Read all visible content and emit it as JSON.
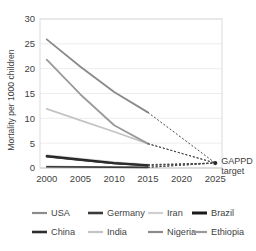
{
  "chart_data": {
    "type": "line",
    "title": "",
    "xlabel": "",
    "ylabel": "Mortality per 1000 children",
    "x": [
      2000,
      2005,
      2010,
      2015,
      2020,
      2025
    ],
    "xlim": [
      1999,
      2026
    ],
    "ylim": [
      0,
      30
    ],
    "yticks": [
      0,
      5,
      10,
      15,
      20,
      25,
      30
    ],
    "xticks": [
      2000,
      2005,
      2010,
      2015,
      2020,
      2025
    ],
    "xtick_labels": [
      "2000",
      "2005",
      "2010",
      "2015",
      "2020",
      "2025"
    ],
    "ytick_labels": [
      "0",
      "5",
      "10",
      "15",
      "20",
      "25",
      "30"
    ],
    "grid": true,
    "legend_position": "bottom",
    "projection_style": "dotted",
    "projection_from_year": 2015,
    "target_year": 2025,
    "target_value": 1,
    "annotations": [
      {
        "name": "gappd-target",
        "line1": "GAPPD",
        "line2": "target",
        "x": 2025,
        "y": 1
      }
    ],
    "series": [
      {
        "name": "USA",
        "color": "#8c8c8c",
        "width": 1.6,
        "x": [
          2000,
          2005,
          2010,
          2015
        ],
        "values": [
          0.3,
          0.25,
          0.2,
          0.15
        ],
        "projection": [
          0.15,
          1
        ]
      },
      {
        "name": "Germany",
        "color": "#3a3a3a",
        "width": 1.6,
        "x": [
          2000,
          2005,
          2010,
          2015
        ],
        "values": [
          0.25,
          0.2,
          0.15,
          0.12
        ],
        "projection": [
          0.12,
          1
        ]
      },
      {
        "name": "Iran",
        "color": "#d0d0d0",
        "width": 1.6,
        "x": [
          2000,
          2005,
          2010,
          2015
        ],
        "values": [
          2.6,
          1.9,
          1.2,
          0.7
        ],
        "projection": [
          0.7,
          1
        ]
      },
      {
        "name": "Brazil",
        "color": "#1a1a1a",
        "width": 2.2,
        "x": [
          2000,
          2005,
          2010,
          2015
        ],
        "values": [
          2.4,
          1.7,
          1.0,
          0.55
        ],
        "projection": [
          0.55,
          1
        ]
      },
      {
        "name": "China",
        "color": "#2e2e2e",
        "width": 1.8,
        "x": [
          2000,
          2005,
          2010,
          2015
        ],
        "values": [
          2.3,
          1.6,
          0.95,
          0.5
        ],
        "projection": [
          0.5,
          1
        ]
      },
      {
        "name": "India",
        "color": "#c4c4c4",
        "width": 1.8,
        "x": [
          2000,
          2005,
          2010,
          2015
        ],
        "values": [
          11.9,
          9.6,
          7.3,
          4.9
        ],
        "projection": [
          4.9,
          1
        ]
      },
      {
        "name": "Nigeria",
        "color": "#8a8a8a",
        "width": 1.8,
        "x": [
          2000,
          2005,
          2010,
          2015
        ],
        "values": [
          25.9,
          20.4,
          15.3,
          11.2
        ],
        "projection": [
          11.2,
          1
        ]
      },
      {
        "name": "Ethiopia",
        "color": "#9a9a9a",
        "width": 1.8,
        "x": [
          2000,
          2005,
          2010,
          2015
        ],
        "values": [
          21.8,
          14.8,
          8.6,
          4.9
        ],
        "projection": [
          4.9,
          1
        ]
      }
    ]
  },
  "legend": {
    "rows": [
      [
        {
          "label": "USA",
          "color": "#8c8c8c",
          "width": 2.2
        },
        {
          "label": "Germany",
          "color": "#3a3a3a",
          "width": 2.6
        },
        {
          "label": "Iran",
          "color": "#d0d0d0",
          "width": 2.2
        },
        {
          "label": "Brazil",
          "color": "#1a1a1a",
          "width": 3.0
        }
      ],
      [
        {
          "label": "China",
          "color": "#2e2e2e",
          "width": 2.6
        },
        {
          "label": "India",
          "color": "#c4c4c4",
          "width": 2.2
        },
        {
          "label": "Nigeria",
          "color": "#8a8a8a",
          "width": 2.2
        },
        {
          "label": "Ethiopia",
          "color": "#9a9a9a",
          "width": 2.2
        }
      ]
    ]
  },
  "colors": {
    "background": "#ffffff",
    "text": "#3f3f3f",
    "grid": "#e8e8e8",
    "plot_border": "#d8d8d8",
    "projection": "#4a4a4a",
    "target_marker": "#2a2a2a"
  }
}
